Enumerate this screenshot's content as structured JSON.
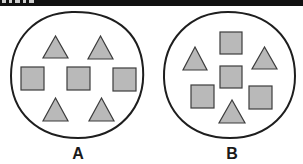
{
  "colors": {
    "outline": "#1e1e1e",
    "shape_fill": "#b9b9b9",
    "shape_stroke": "#3c3c3c",
    "topbar": "#111111"
  },
  "panels": [
    {
      "label": "A",
      "shapes": [
        {
          "type": "triangle",
          "position": "top-left"
        },
        {
          "type": "triangle",
          "position": "top-right"
        },
        {
          "type": "square",
          "position": "middle-left"
        },
        {
          "type": "square",
          "position": "middle-center"
        },
        {
          "type": "square",
          "position": "middle-right"
        },
        {
          "type": "triangle",
          "position": "bottom-left"
        },
        {
          "type": "triangle",
          "position": "bottom-right"
        }
      ],
      "counts": {
        "triangles": 4,
        "squares": 3
      }
    },
    {
      "label": "B",
      "shapes": [
        {
          "type": "square",
          "position": "top-center"
        },
        {
          "type": "triangle",
          "position": "upper-left"
        },
        {
          "type": "triangle",
          "position": "upper-right"
        },
        {
          "type": "square",
          "position": "center"
        },
        {
          "type": "square",
          "position": "lower-left"
        },
        {
          "type": "square",
          "position": "lower-right"
        },
        {
          "type": "triangle",
          "position": "bottom-center"
        }
      ],
      "counts": {
        "triangles": 3,
        "squares": 4
      }
    }
  ]
}
